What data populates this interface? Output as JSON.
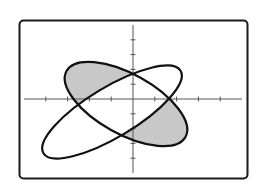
{
  "figure": {
    "description": "Graphing calculator window showing two intersecting rotated ellipses with the regions inside one ellipse but outside the other shaded",
    "colors": {
      "background": "#ffffff",
      "frame": "#1a1a1a",
      "axis": "#555555",
      "curve": "#111111",
      "shade": "#c8c8c8"
    },
    "window": {
      "xmin": -5,
      "xmax": 5,
      "xscl": 1,
      "ymin": -5,
      "ymax": 5,
      "yscl": 1
    },
    "pixel_map": {
      "origin": [
        133,
        99
      ],
      "x_unit_px": 21.8,
      "y_unit_px": 14.8
    },
    "x_ticks": [
      -4,
      -3,
      -2,
      -1,
      1,
      2,
      3,
      4
    ],
    "y_ticks": [
      -4,
      -3,
      -2,
      -1,
      1,
      2,
      3,
      4
    ],
    "ellipse_a": {
      "name": "long ellipse rising left-to-right",
      "center_px": [
        112,
        112
      ],
      "rx_px": 80,
      "ry_px": 25,
      "rotation_deg": -31
    },
    "ellipse_b": {
      "name": "ellipse falling left-to-right",
      "center_px": [
        126,
        104
      ],
      "rx_px": 68,
      "ry_px": 30,
      "rotation_deg": 29
    },
    "shaded_regions": "inside ellipse_b and outside ellipse_a (upper-left and lower-right lobes)"
  }
}
